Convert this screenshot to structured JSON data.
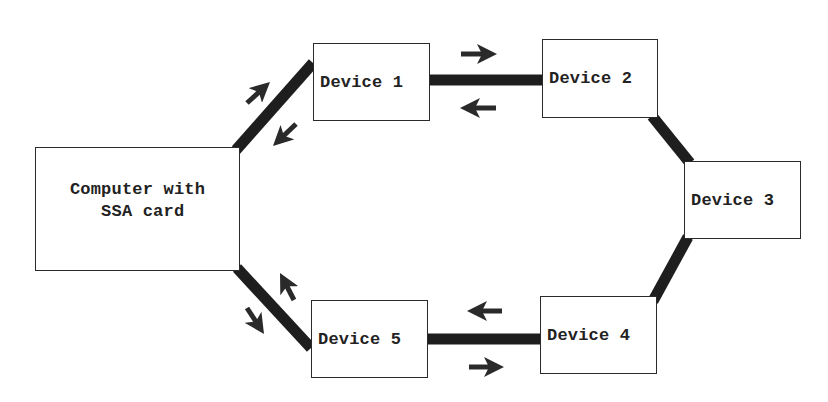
{
  "diagram": {
    "type": "ring-topology",
    "colors": {
      "link": "#1e1e1e",
      "arrow": "#2a2a2a",
      "box_border": "#2a2a2a",
      "text": "#222222",
      "background": "#ffffff"
    },
    "nodes": [
      {
        "id": "computer",
        "label": "Computer with\n SSA card",
        "x": 35,
        "y": 147,
        "w": 205,
        "h": 124
      },
      {
        "id": "device1",
        "label": "Device 1",
        "x": 313,
        "y": 43,
        "w": 117,
        "h": 78
      },
      {
        "id": "device2",
        "label": "Device 2",
        "x": 542,
        "y": 39,
        "w": 116,
        "h": 79
      },
      {
        "id": "device3",
        "label": "Device 3",
        "x": 684,
        "y": 161,
        "w": 117,
        "h": 78
      },
      {
        "id": "device4",
        "label": "Device 4",
        "x": 540,
        "y": 296,
        "w": 117,
        "h": 78
      },
      {
        "id": "device5",
        "label": "Device 5",
        "x": 311,
        "y": 300,
        "w": 117,
        "h": 78
      }
    ],
    "links": [
      {
        "from": "computer",
        "to": "device1",
        "x1": 236,
        "y1": 150,
        "x2": 313,
        "y2": 63
      },
      {
        "from": "device1",
        "to": "device2",
        "x1": 430,
        "y1": 80,
        "x2": 542,
        "y2": 80
      },
      {
        "from": "device2",
        "to": "device3",
        "x1": 652,
        "y1": 116,
        "x2": 690,
        "y2": 163
      },
      {
        "from": "device3",
        "to": "device4",
        "x1": 688,
        "y1": 237,
        "x2": 653,
        "y2": 301
      },
      {
        "from": "device4",
        "to": "device5",
        "x1": 540,
        "y1": 339,
        "x2": 428,
        "y2": 339
      },
      {
        "from": "device5",
        "to": "computer",
        "x1": 311,
        "y1": 348,
        "x2": 237,
        "y2": 268
      }
    ],
    "arrows": [
      {
        "id": "arrow-c-d1-out",
        "direction": "north-east",
        "x1": 247,
        "y1": 103,
        "x2": 270,
        "y2": 82
      },
      {
        "id": "arrow-d1-c-in",
        "direction": "south-west",
        "x1": 296,
        "y1": 124,
        "x2": 273,
        "y2": 146
      },
      {
        "id": "arrow-d1-d2-out",
        "direction": "east",
        "x1": 461,
        "y1": 54,
        "x2": 497,
        "y2": 54
      },
      {
        "id": "arrow-d2-d1-in",
        "direction": "west",
        "x1": 496,
        "y1": 108,
        "x2": 460,
        "y2": 108
      },
      {
        "id": "arrow-d4-d5-in",
        "direction": "west",
        "x1": 502,
        "y1": 311,
        "x2": 467,
        "y2": 311
      },
      {
        "id": "arrow-d5-d4-out",
        "direction": "east",
        "x1": 469,
        "y1": 367,
        "x2": 504,
        "y2": 367
      },
      {
        "id": "arrow-d5-c-in",
        "direction": "north-west",
        "x1": 294,
        "y1": 300,
        "x2": 280,
        "y2": 273
      },
      {
        "id": "arrow-c-d5-out",
        "direction": "south-east",
        "x1": 247,
        "y1": 308,
        "x2": 264,
        "y2": 334
      }
    ]
  }
}
